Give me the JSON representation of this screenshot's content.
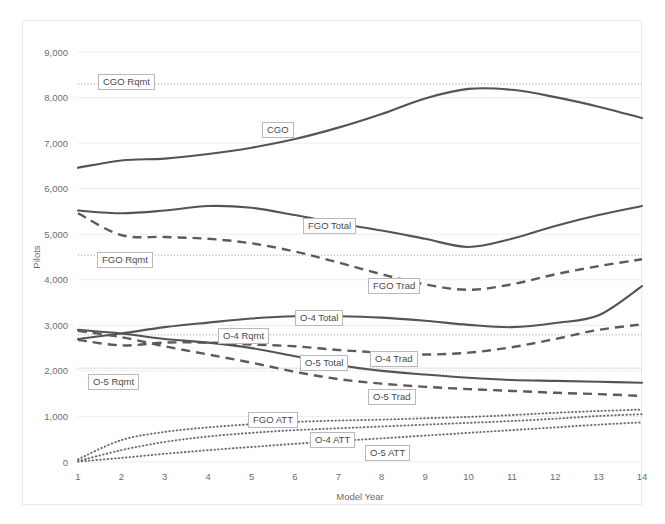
{
  "page": {
    "background_color": "#ffffff",
    "frame_border_color": "#ececee"
  },
  "chart_data": {
    "type": "line",
    "title": "",
    "xlabel": "Model Year",
    "ylabel": "Pilots",
    "x": [
      1,
      2,
      3,
      4,
      5,
      6,
      7,
      8,
      9,
      10,
      11,
      12,
      13,
      14
    ],
    "xlim": [
      1,
      14
    ],
    "ylim": [
      0,
      9000
    ],
    "ytick_labels": [
      "0",
      "1,000",
      "2,000",
      "3,000",
      "4,000",
      "5,000",
      "6,000",
      "7,000",
      "8,000",
      "9,000"
    ],
    "ytick_values": [
      0,
      1000,
      2000,
      3000,
      4000,
      5000,
      6000,
      7000,
      8000,
      9000
    ],
    "xtick_labels": [
      "1",
      "2",
      "3",
      "4",
      "5",
      "6",
      "7",
      "8",
      "9",
      "10",
      "11",
      "12",
      "13",
      "14"
    ],
    "grid": true,
    "grid_axis": "y",
    "legend": "inline-callouts",
    "series": [
      {
        "name": "CGO",
        "label": "CGO",
        "style": "solid",
        "color": "#545457",
        "values": [
          6460,
          6620,
          6660,
          6760,
          6900,
          7090,
          7340,
          7640,
          7980,
          8190,
          8170,
          8010,
          7800,
          7550
        ]
      },
      {
        "name": "FGO Total",
        "label": "FGO Total",
        "style": "solid",
        "color": "#545457",
        "values": [
          5520,
          5460,
          5520,
          5620,
          5580,
          5420,
          5240,
          5080,
          4900,
          4720,
          4900,
          5180,
          5420,
          5620
        ]
      },
      {
        "name": "FGO Trad",
        "label": "FGO Trad",
        "style": "dashed",
        "color": "#5b5b5e",
        "values": [
          5460,
          4980,
          4940,
          4900,
          4800,
          4620,
          4380,
          4120,
          3900,
          3780,
          3900,
          4120,
          4300,
          4450
        ]
      },
      {
        "name": "O-4 Total",
        "label": "O-4 Total",
        "style": "solid",
        "color": "#545457",
        "values": [
          2700,
          2820,
          2960,
          3060,
          3150,
          3200,
          3200,
          3170,
          3100,
          3010,
          2960,
          3050,
          3220,
          3860
        ]
      },
      {
        "name": "O-4 Trad",
        "label": "O-4 Trad",
        "style": "dashed",
        "color": "#5b5b5e",
        "values": [
          2680,
          2560,
          2620,
          2620,
          2580,
          2540,
          2460,
          2400,
          2360,
          2400,
          2520,
          2700,
          2900,
          3020
        ]
      },
      {
        "name": "O-5 Total",
        "label": "O-5 Total",
        "style": "solid",
        "color": "#545457",
        "values": [
          2900,
          2820,
          2700,
          2620,
          2500,
          2320,
          2130,
          2000,
          1920,
          1850,
          1800,
          1780,
          1760,
          1740
        ]
      },
      {
        "name": "O-5 Trad",
        "label": "O-5 Trad",
        "style": "dashed",
        "color": "#5b5b5e",
        "values": [
          2880,
          2740,
          2540,
          2360,
          2180,
          1980,
          1820,
          1720,
          1650,
          1600,
          1560,
          1520,
          1490,
          1450
        ]
      },
      {
        "name": "FGO ATT",
        "label": "FGO ATT",
        "style": "dotted",
        "color": "#6e6e72",
        "values": [
          60,
          480,
          660,
          760,
          830,
          880,
          910,
          930,
          960,
          990,
          1030,
          1080,
          1120,
          1150
        ]
      },
      {
        "name": "O-4 ATT",
        "label": "O-4 ATT",
        "style": "dotted",
        "color": "#6e6e72",
        "values": [
          20,
          260,
          440,
          560,
          640,
          700,
          740,
          780,
          820,
          860,
          900,
          950,
          1010,
          1050
        ]
      },
      {
        "name": "O-5 ATT",
        "label": "O-5 ATT",
        "style": "dotted",
        "color": "#6e6e72",
        "values": [
          10,
          90,
          180,
          260,
          330,
          400,
          460,
          520,
          580,
          640,
          700,
          760,
          820,
          870
        ]
      }
    ],
    "reference_lines": [
      {
        "name": "CGO Rqmt",
        "label": "CGO Rqmt",
        "value": 8300,
        "style": "dotted",
        "color": "#9a9a9e"
      },
      {
        "name": "FGO Rqmt",
        "label": "FGO Rqmt",
        "value": 4540,
        "style": "dotted",
        "color": "#9a9a9e"
      },
      {
        "name": "O-4 Rqmt",
        "label": "O-4 Rqmt",
        "value": 2790,
        "style": "dotted",
        "color": "#9a9a9e"
      },
      {
        "name": "O-5 Rqmt",
        "label": "O-5 Rqmt",
        "value": 2060,
        "style": "dotted",
        "color": "#9a9a9e"
      }
    ],
    "callouts": [
      {
        "label": "CGO Rqmt",
        "x": 98,
        "y": 74
      },
      {
        "label": "CGO",
        "x": 262,
        "y": 122
      },
      {
        "label": "FGO Total",
        "x": 303,
        "y": 218
      },
      {
        "label": "FGO Rqmt",
        "x": 97,
        "y": 252
      },
      {
        "label": "FGO Trad",
        "x": 368,
        "y": 278
      },
      {
        "label": "O-4 Total",
        "x": 295,
        "y": 310
      },
      {
        "label": "O-4 Rqmt",
        "x": 218,
        "y": 328
      },
      {
        "label": "O-5 Total",
        "x": 300,
        "y": 355
      },
      {
        "label": "O-4 Trad",
        "x": 370,
        "y": 351
      },
      {
        "label": "O-5 Rqmt",
        "x": 88,
        "y": 374
      },
      {
        "label": "O-5 Trad",
        "x": 368,
        "y": 389
      },
      {
        "label": "FGO ATT",
        "x": 248,
        "y": 412
      },
      {
        "label": "O-4 ATT",
        "x": 310,
        "y": 432
      },
      {
        "label": "O-5 ATT",
        "x": 365,
        "y": 445
      }
    ]
  }
}
